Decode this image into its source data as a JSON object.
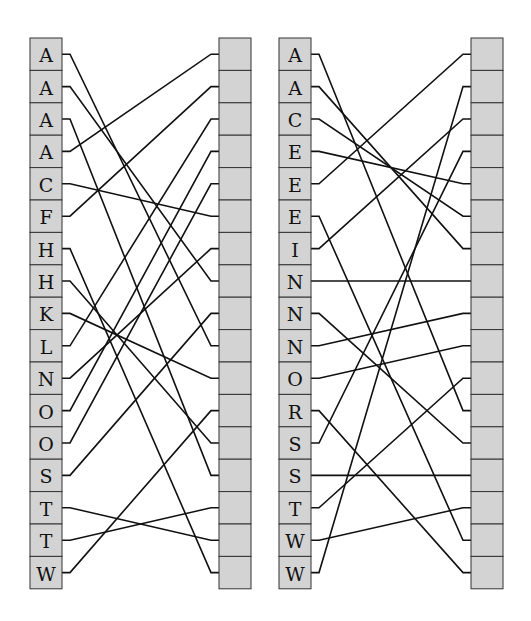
{
  "diagrams": [
    {
      "name": "left-matching",
      "left_x": 30,
      "right_x": 219,
      "box_w": 32,
      "top": 38,
      "row_h": 32.4,
      "left_labels": [
        "A",
        "A",
        "A",
        "A",
        "C",
        "F",
        "H",
        "H",
        "K",
        "L",
        "N",
        "O",
        "O",
        "S",
        "T",
        "T",
        "W"
      ],
      "right_labels": [
        "",
        "",
        "",
        "",
        "",
        "",
        "",
        "",
        "",
        "",
        "",
        "",
        "",
        "",
        "",
        "",
        ""
      ],
      "edges": [
        [
          0,
          9
        ],
        [
          1,
          7
        ],
        [
          2,
          13
        ],
        [
          3,
          0
        ],
        [
          4,
          5
        ],
        [
          5,
          1
        ],
        [
          6,
          16
        ],
        [
          7,
          12
        ],
        [
          8,
          10
        ],
        [
          9,
          2
        ],
        [
          10,
          6
        ],
        [
          11,
          3
        ],
        [
          12,
          4
        ],
        [
          13,
          8
        ],
        [
          14,
          15
        ],
        [
          15,
          14
        ],
        [
          16,
          11
        ]
      ]
    },
    {
      "name": "right-matching",
      "left_x": 279,
      "right_x": 471,
      "box_w": 32,
      "top": 38,
      "row_h": 32.4,
      "left_labels": [
        "A",
        "A",
        "C",
        "E",
        "E",
        "E",
        "I",
        "N",
        "N",
        "N",
        "O",
        "R",
        "S",
        "S",
        "T",
        "W",
        "W"
      ],
      "right_labels": [
        "",
        "",
        "",
        "",
        "",
        "",
        "",
        "",
        "",
        "",
        "",
        "",
        "",
        "",
        "",
        "",
        ""
      ],
      "edges": [
        [
          0,
          11
        ],
        [
          1,
          6
        ],
        [
          2,
          5
        ],
        [
          3,
          4
        ],
        [
          4,
          0
        ],
        [
          5,
          15
        ],
        [
          6,
          2
        ],
        [
          7,
          7
        ],
        [
          8,
          12
        ],
        [
          9,
          8
        ],
        [
          10,
          9
        ],
        [
          11,
          16
        ],
        [
          12,
          3
        ],
        [
          13,
          13
        ],
        [
          14,
          10
        ],
        [
          15,
          14
        ],
        [
          16,
          1
        ]
      ]
    }
  ]
}
